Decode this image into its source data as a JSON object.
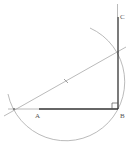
{
  "diagram": {
    "type": "geometric-construction",
    "colors": {
      "background": "#ffffff",
      "thick_line": "#333333",
      "thin_line": "#9a9a9a",
      "label": "#555555"
    },
    "points": {
      "A": {
        "label": "A",
        "x": 39,
        "y": 109
      },
      "B": {
        "label": "B",
        "x": 118,
        "y": 109
      },
      "C": {
        "label": "C",
        "x": 118,
        "y": 17
      },
      "M": {
        "label": "",
        "x": 66,
        "y": 81
      }
    },
    "labels": {
      "A": "A",
      "B": "B",
      "C": "C"
    }
  }
}
